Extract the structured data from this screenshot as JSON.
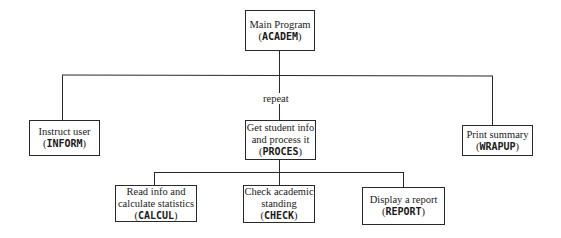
{
  "diagram": {
    "type": "structure-chart",
    "root": {
      "desc": "Main Program",
      "module": "ACADEM"
    },
    "level1": [
      {
        "desc": "Instruct user",
        "module": "INFORM"
      },
      {
        "desc_lines": [
          "Get student info",
          "and process it"
        ],
        "module": "PROCES",
        "connector_label": "repeat"
      },
      {
        "desc": "Print summary",
        "module": "WRAPUP"
      }
    ],
    "level2": [
      {
        "desc_lines": [
          "Read info and",
          "calculate statistics"
        ],
        "module": "CALCUL"
      },
      {
        "desc_lines": [
          "Check academic",
          "standing"
        ],
        "module": "CHECK"
      },
      {
        "desc": "Display a report",
        "module": "REPORT"
      }
    ]
  }
}
